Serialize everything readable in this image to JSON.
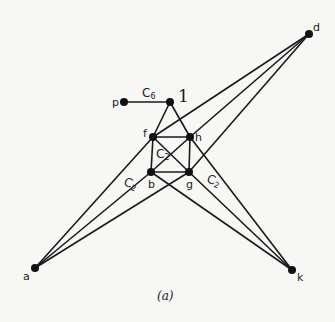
{
  "diagram": {
    "caption": "(a)",
    "nodes": [
      {
        "id": "p",
        "label": "p",
        "x": 124,
        "y": 102
      },
      {
        "id": "l",
        "label": "1",
        "x": 170,
        "y": 102
      },
      {
        "id": "f",
        "label": "f",
        "x": 153,
        "y": 137
      },
      {
        "id": "h",
        "label": "h",
        "x": 190,
        "y": 137
      },
      {
        "id": "b",
        "label": "b",
        "x": 151,
        "y": 172
      },
      {
        "id": "g",
        "label": "g",
        "x": 189,
        "y": 172
      },
      {
        "id": "a",
        "label": "a",
        "x": 35,
        "y": 268
      },
      {
        "id": "k",
        "label": "k",
        "x": 292,
        "y": 270
      },
      {
        "id": "d",
        "label": "d",
        "x": 309,
        "y": 34
      }
    ],
    "edges": [
      [
        "p",
        "l"
      ],
      [
        "l",
        "f"
      ],
      [
        "l",
        "h"
      ],
      [
        "f",
        "h"
      ],
      [
        "f",
        "b"
      ],
      [
        "h",
        "g"
      ],
      [
        "b",
        "g"
      ],
      [
        "f",
        "g"
      ],
      [
        "h",
        "b"
      ],
      [
        "a",
        "f"
      ],
      [
        "a",
        "b"
      ],
      [
        "a",
        "g"
      ],
      [
        "d",
        "f"
      ],
      [
        "d",
        "h"
      ],
      [
        "d",
        "g"
      ],
      [
        "k",
        "h"
      ],
      [
        "k",
        "g"
      ],
      [
        "k",
        "b"
      ]
    ],
    "edge_labels": {
      "c6": {
        "main": "C",
        "sub": "6"
      },
      "c2_center": {
        "main": "C",
        "sub": "2"
      },
      "c2_left": {
        "main": "C",
        "sub": "2"
      },
      "c2_right": {
        "main": "C",
        "sub": "2"
      }
    }
  }
}
